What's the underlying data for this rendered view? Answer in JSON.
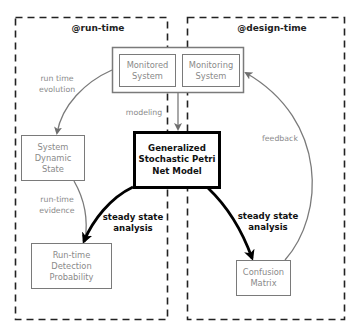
{
  "regions": {
    "runtime": {
      "title": "@run-time"
    },
    "designtime": {
      "title": "@design-time"
    }
  },
  "nodes": {
    "monitored_system": "Monitored\nSystem",
    "monitoring_system": "Monitoring\nSystem",
    "gspn_model": "Generalized\nStochastic Petri\nNet Model",
    "system_dynamic_state": "System\nDynamic\nState",
    "runtime_detection_probability": "Run-time\nDetection\nProbability",
    "confusion_matrix": "Confusion\nMatrix"
  },
  "edges": {
    "run_time_evolution": "run time\nevolution",
    "modeling": "modeling",
    "run_time_evidence": "run-time\nevidence",
    "steady_state_left": "steady state\nanalysis",
    "steady_state_right": "steady state\nanalysis",
    "feedback": "feedback"
  },
  "colors": {
    "gray_line": "#7a7a7a",
    "black_line": "#000000",
    "dash": "#222222"
  }
}
